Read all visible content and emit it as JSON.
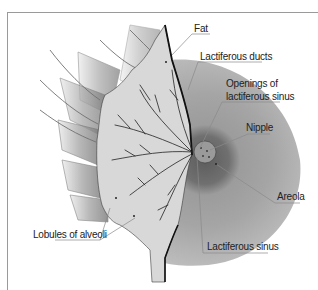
{
  "diagram": {
    "colors": {
      "frame": "#9a9a9a",
      "tissue": "#d6d6d6",
      "ducts": "#2a2a2a",
      "areola_outer": "#a8a8a8",
      "areola_dark": "#6e6e6e",
      "muscle": "#8c8c8c",
      "leader": "#8a8a8a"
    },
    "labels": [
      {
        "id": "fat",
        "text": "Fat"
      },
      {
        "id": "lactiferous-ducts",
        "text": "Lactiferous ducts"
      },
      {
        "id": "openings-line1",
        "text": "Openings of"
      },
      {
        "id": "openings-line2",
        "text": "lactiferous sinus"
      },
      {
        "id": "nipple",
        "text": "Nipple"
      },
      {
        "id": "areola",
        "text": "Areola"
      },
      {
        "id": "lobules",
        "text": "Lobules of alveoli"
      },
      {
        "id": "lactiferous-sinus",
        "text": "Lactiferous sinus"
      }
    ]
  }
}
